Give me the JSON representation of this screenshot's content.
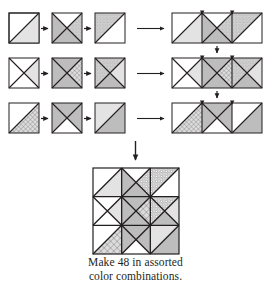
{
  "figure": {
    "caption_line1": "Make 48 in assorted",
    "caption_line2": "color combinations.",
    "arrow_icon_name": "arrow-right-icon",
    "arrow_down_icon_name": "arrow-down-icon"
  },
  "palette": {
    "outline": "#231f20",
    "white": "#ffffff",
    "light_gray": "#e3e3e3",
    "mid_gray": "#bdbdbd",
    "dot_fill": "#d2d2d2",
    "dot_ink": "#6e6e6e",
    "grid_fill": "#dcdcdc",
    "grid_ink": "#555555"
  },
  "legend": {
    "fabrics": [
      {
        "key": "white",
        "label": "white / background"
      },
      {
        "key": "light_gray",
        "label": "light solid"
      },
      {
        "key": "mid_gray",
        "label": "medium solid"
      },
      {
        "key": "dotted",
        "label": "dotted print"
      },
      {
        "key": "grid",
        "label": "grid / crosshatch print"
      }
    ]
  },
  "units": {
    "rows": [
      {
        "row_label": "row-1",
        "units": [
          {
            "name": "unit-1-1",
            "kind": "half-square-triangle",
            "upper_left": "white",
            "lower_right": "light_gray"
          },
          {
            "name": "unit-1-2",
            "kind": "quarter-square-triangle",
            "top": "white",
            "left": "mid_gray",
            "right": "dotted",
            "bottom": "mid_gray"
          },
          {
            "name": "unit-1-3",
            "kind": "half-square-triangle",
            "upper_left": "dotted",
            "lower_right": "white"
          }
        ],
        "strip_name": "strip-row-1"
      },
      {
        "row_label": "row-2",
        "units": [
          {
            "name": "unit-2-1",
            "kind": "quarter-square-triangle",
            "top": "white",
            "left": "white",
            "right": "light_gray",
            "bottom": "white"
          },
          {
            "name": "unit-2-2",
            "kind": "quarter-square-triangle",
            "top": "mid_gray",
            "left": "mid_gray",
            "right": "grid",
            "bottom": "mid_gray"
          },
          {
            "name": "unit-2-3",
            "kind": "quarter-square-triangle",
            "top": "dotted",
            "left": "dotted",
            "right": "light_gray",
            "bottom": "mid_gray"
          }
        ],
        "strip_name": "strip-row-2"
      },
      {
        "row_label": "row-3",
        "units": [
          {
            "name": "unit-3-1",
            "kind": "half-square-triangle",
            "upper_left": "white",
            "lower_right": "grid"
          },
          {
            "name": "unit-3-2",
            "kind": "quarter-square-triangle",
            "top": "mid_gray",
            "left": "mid_gray",
            "right": "mid_gray",
            "bottom": "white"
          },
          {
            "name": "unit-3-3",
            "kind": "half-square-triangle",
            "upper_left": "light_gray",
            "lower_right": "mid_gray"
          }
        ],
        "strip_name": "strip-row-3"
      }
    ]
  },
  "final_block": {
    "name": "finished-block",
    "grid": "3x3",
    "description": "nine joined units forming on-point square lattice"
  }
}
